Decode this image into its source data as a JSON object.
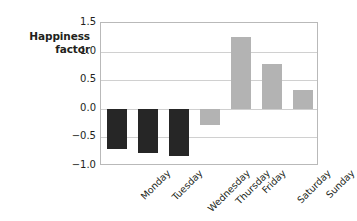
{
  "chart_data": {
    "type": "bar",
    "title": "",
    "subtitle": "",
    "xlabel": "",
    "ylabel": "Happiness\nfactor",
    "ylabel_line1": "Happiness",
    "ylabel_line2": "factor",
    "categories": [
      "Monday",
      "Tuesday",
      "Wednesday",
      "Thursday",
      "Friday",
      "Saturday",
      "Sunday"
    ],
    "values": [
      -0.7,
      -0.77,
      -0.82,
      -0.28,
      1.25,
      0.78,
      0.33
    ],
    "bar_colors": [
      "#262626",
      "#262626",
      "#262626",
      "#b3b3b3",
      "#b3b3b3",
      "#b3b3b3",
      "#b3b3b3"
    ],
    "ylim": [
      -1.0,
      1.5
    ],
    "yticks": [
      1.5,
      1.0,
      0.5,
      0.0,
      -0.5,
      -1.0
    ],
    "ytick_labels": [
      "1.5",
      "1.0",
      "0.5",
      "0.0",
      "−0.5",
      "−1.0"
    ],
    "grid": true,
    "grid_axis": "y",
    "legend": false,
    "legend_position": "none",
    "xtick_rotation": -45,
    "negative_color": "#262626",
    "positive_color": "#b3b3b3",
    "axis_color": "#b9b9b9",
    "grid_color": "#d0d0d0",
    "text_color": "#231f20",
    "background": "#ffffff"
  }
}
